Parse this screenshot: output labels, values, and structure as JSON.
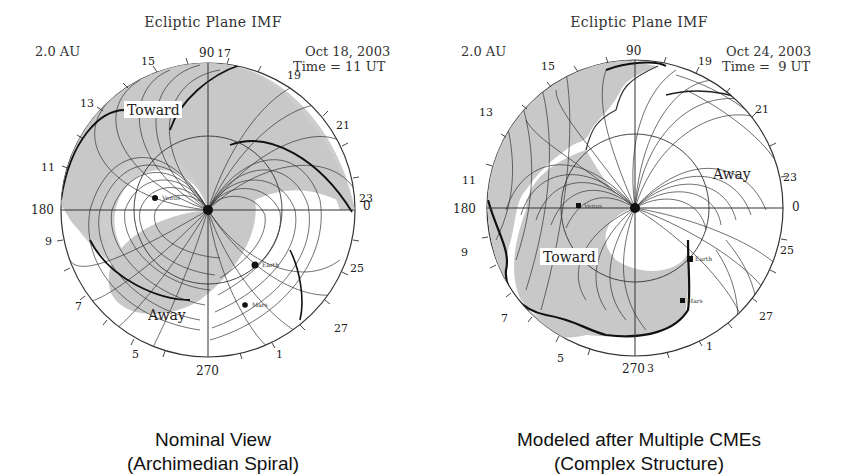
{
  "panels": [
    {
      "id": "left",
      "title": "Ecliptic Plane IMF",
      "scale_label": "2.0 AU",
      "date": "Oct 18, 2003",
      "time": "Time = 11 UT",
      "sector_labels": {
        "toward": "Toward",
        "away": "Away"
      },
      "planets": [
        "Venus",
        "Earth",
        "Mars"
      ],
      "angle_labels": [
        "90",
        "180",
        "270",
        "0"
      ],
      "day_ticks": [
        "17",
        "15",
        "13",
        "11",
        "9",
        "7",
        "5",
        "3",
        "1",
        "27",
        "25",
        "23",
        "21",
        "19"
      ],
      "caption_line1": "Nominal View",
      "caption_line2": "(Archimedian Spiral)"
    },
    {
      "id": "right",
      "title": "Ecliptic Plane IMF",
      "scale_label": "2.0 AU",
      "date": "Oct 24, 2003",
      "time": "Time =  9 UT",
      "sector_labels": {
        "toward": "Toward",
        "away": "Away"
      },
      "planets": [
        "Venus",
        "Earth",
        "Mars"
      ],
      "angle_labels": [
        "90",
        "180",
        "270",
        "0"
      ],
      "day_ticks": [
        "19",
        "21",
        "23",
        "25",
        "27",
        "1",
        "3",
        "5",
        "7",
        "9",
        "11",
        "13",
        "15"
      ],
      "caption_line1": "Modeled after Multiple CMEs",
      "caption_line2": "(Complex Structure)"
    }
  ],
  "colors": {
    "toward_fill": "#c8c8c8",
    "line": "#333333",
    "background": "#ffffff"
  }
}
